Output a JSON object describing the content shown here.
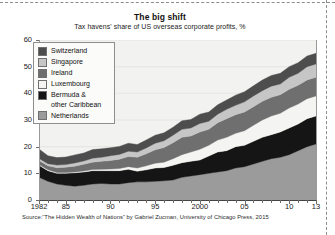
{
  "header": {
    "title": "The big shift",
    "subtitle": "Tax havens' share of US overseas corporate profits, %"
  },
  "source": {
    "text": "Source:“The Hidden Wealth of Nations” by Gabriel Zucman, University of Chicago Press, 2015"
  },
  "legend": {
    "position": "inside-top-left",
    "items": [
      {
        "label": "Switzerland",
        "color": "#4d4d4d"
      },
      {
        "label": "Singapore",
        "color": "#c6c6c6"
      },
      {
        "label": "Ireland",
        "color": "#6f6f6f"
      },
      {
        "label": "Luxembourg",
        "color": "#f4f4f2"
      },
      {
        "label": "Bermuda &\nother Caribbean",
        "color": "#151515"
      },
      {
        "label": "Netherlands",
        "color": "#9b9b9b"
      }
    ]
  },
  "chart_data": {
    "type": "area",
    "stacked": true,
    "title": "The big shift",
    "subtitle": "Tax havens' share of US overseas corporate profits, %",
    "xlabel": "",
    "ylabel": "",
    "ylim": [
      0,
      60
    ],
    "yticks": [
      0,
      10,
      20,
      30,
      40,
      50,
      60
    ],
    "xlim": [
      1982,
      2013
    ],
    "xticks": [
      1982,
      1985,
      1990,
      1995,
      2000,
      2005,
      2010,
      2013
    ],
    "xtick_labels": [
      "1982",
      "85",
      "90",
      "95",
      "2000",
      "05",
      "10",
      "13"
    ],
    "minor_tick_interval": 1,
    "grid": "horizontal-faint",
    "plot_background": "#f2f2f0",
    "x": [
      1982,
      1983,
      1984,
      1985,
      1986,
      1987,
      1988,
      1989,
      1990,
      1991,
      1992,
      1993,
      1994,
      1995,
      1996,
      1997,
      1998,
      1999,
      2000,
      2001,
      2002,
      2003,
      2004,
      2005,
      2006,
      2007,
      2008,
      2009,
      2010,
      2011,
      2012,
      2013
    ],
    "series": [
      {
        "name": "Netherlands",
        "color": "#9b9b9b",
        "stack_order": 1,
        "values": [
          8.5,
          7.0,
          6.0,
          5.5,
          5.2,
          5.5,
          6.0,
          6.2,
          6.0,
          6.0,
          6.5,
          6.8,
          6.8,
          7.0,
          7.2,
          7.5,
          8.5,
          9.0,
          9.5,
          10.0,
          10.5,
          11.0,
          12.0,
          12.5,
          13.5,
          14.5,
          15.5,
          16.0,
          17.0,
          18.5,
          20.0,
          21.0
        ]
      },
      {
        "name": "Bermuda & other Caribbean",
        "color": "#151515",
        "stack_order": 2,
        "values": [
          4.5,
          4.0,
          4.0,
          4.5,
          5.0,
          5.0,
          5.0,
          4.8,
          5.0,
          5.0,
          5.0,
          4.0,
          4.5,
          5.0,
          5.0,
          5.5,
          5.5,
          5.5,
          5.5,
          6.5,
          7.5,
          7.5,
          8.0,
          8.0,
          8.5,
          9.0,
          9.0,
          9.5,
          10.0,
          10.0,
          10.5,
          10.5
        ]
      },
      {
        "name": "Luxembourg",
        "color": "#f4f4f2",
        "stack_order": 3,
        "values": [
          0.3,
          0.3,
          0.3,
          0.3,
          0.3,
          0.4,
          0.4,
          0.5,
          0.6,
          0.8,
          1.0,
          1.2,
          1.5,
          1.8,
          2.0,
          2.5,
          3.0,
          3.5,
          4.0,
          4.0,
          4.5,
          5.0,
          5.0,
          5.5,
          6.0,
          6.5,
          7.0,
          7.0,
          7.5,
          7.5,
          7.5,
          7.5
        ]
      },
      {
        "name": "Ireland",
        "color": "#6f6f6f",
        "stack_order": 4,
        "values": [
          1.5,
          1.5,
          1.8,
          2.0,
          2.2,
          2.5,
          2.8,
          3.0,
          3.2,
          3.5,
          3.8,
          4.0,
          4.5,
          5.0,
          5.5,
          6.0,
          6.5,
          6.0,
          6.5,
          6.0,
          6.5,
          7.0,
          7.0,
          7.0,
          7.0,
          7.0,
          7.0,
          7.0,
          7.0,
          7.0,
          7.0,
          7.0
        ]
      },
      {
        "name": "Singapore",
        "color": "#c6c6c6",
        "stack_order": 5,
        "values": [
          0.8,
          0.8,
          1.0,
          1.0,
          1.2,
          1.2,
          1.5,
          1.5,
          1.8,
          1.8,
          2.0,
          2.0,
          2.2,
          2.5,
          2.5,
          2.8,
          3.0,
          3.0,
          3.2,
          3.0,
          3.2,
          3.5,
          3.5,
          3.8,
          4.0,
          4.0,
          4.2,
          4.0,
          4.5,
          4.5,
          5.0,
          5.0
        ]
      },
      {
        "name": "Switzerland",
        "color": "#4d4d4d",
        "stack_order": 6,
        "values": [
          3.5,
          3.0,
          2.8,
          2.8,
          3.0,
          3.0,
          3.2,
          3.2,
          3.0,
          3.0,
          3.0,
          2.8,
          3.0,
          3.0,
          3.0,
          3.0,
          3.2,
          3.2,
          3.5,
          3.5,
          3.5,
          3.5,
          3.8,
          3.8,
          3.8,
          4.0,
          4.0,
          4.0,
          4.0,
          4.0,
          4.0,
          4.0
        ]
      }
    ],
    "totals": [
      19.1,
      16.6,
      15.9,
      16.1,
      16.9,
      17.6,
      18.9,
      19.2,
      19.6,
      20.1,
      21.3,
      20.8,
      22.5,
      24.3,
      25.2,
      27.3,
      29.7,
      30.2,
      32.2,
      33.0,
      35.7,
      37.5,
      39.3,
      40.6,
      42.8,
      45.0,
      46.7,
      47.5,
      50.0,
      51.5,
      54.0,
      55.0
    ]
  }
}
